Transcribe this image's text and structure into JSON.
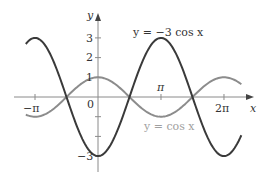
{
  "chart_data": {
    "type": "line",
    "title": "",
    "xlabel": "x",
    "ylabel": "y",
    "xlim": [
      -3.9,
      7.9
    ],
    "ylim": [
      -3.8,
      4.5
    ],
    "grid": false,
    "legend": "inline labels",
    "x_ticks": [
      {
        "value": -3.14159,
        "label": "−π"
      },
      {
        "value": 0,
        "label": "0"
      },
      {
        "value": 3.14159,
        "label": "π"
      },
      {
        "value": 6.28319,
        "label": "2π"
      }
    ],
    "y_ticks": [
      {
        "value": 3,
        "label": "3"
      },
      {
        "value": 2,
        "label": "2"
      },
      {
        "value": 1,
        "label": "1"
      },
      {
        "value": -1,
        "label": ""
      },
      {
        "value": -2,
        "label": ""
      },
      {
        "value": -3,
        "label": "−3"
      }
    ],
    "series": [
      {
        "name": "y = −3 cos x",
        "function": "-3*cos(x)",
        "domain": [
          -3.6,
          7.15
        ],
        "color": "#3a3a3a",
        "x": [
          -3.6,
          -3.14159,
          -1.5708,
          0,
          1.5708,
          3.14159,
          4.71239,
          6.28319,
          7.15
        ],
        "values": [
          2.69,
          3,
          0,
          -3,
          0,
          3,
          0,
          -3,
          -1.95
        ]
      },
      {
        "name": "y = cos x",
        "function": "cos(x)",
        "domain": [
          -3.6,
          7.15
        ],
        "color": "#8c8c8c",
        "x": [
          -3.6,
          -3.14159,
          -1.5708,
          0,
          1.5708,
          3.14159,
          4.71239,
          6.28319,
          7.15
        ],
        "values": [
          -0.9,
          -1,
          0,
          1,
          0,
          -1,
          0,
          1,
          0.65
        ]
      }
    ],
    "annotations": [
      {
        "text": "y = −3 cos x",
        "near": "upper right of first positive peak"
      },
      {
        "text": "y = cos x",
        "near": "below trough at π"
      }
    ]
  },
  "labels": {
    "y_axis": "y",
    "x_axis": "x",
    "tick_neg_pi": "−π",
    "tick_zero": "0",
    "tick_pi": "π",
    "tick_2pi": "2π",
    "tick_y3": "3",
    "tick_y2": "2",
    "tick_y1": "1",
    "tick_yneg3": "−3",
    "series_dark": "y = −3 cos x",
    "series_light": "y = cos x"
  },
  "colors": {
    "axis": "#8a8a8a",
    "dark_curve": "#3a3a3a",
    "light_curve": "#8c8c8c",
    "light_label": "#a0a0a0",
    "text": "#333333"
  }
}
